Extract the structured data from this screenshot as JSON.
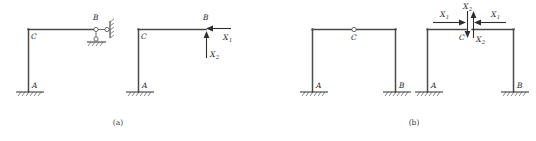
{
  "figure": {
    "captions": [
      {
        "id": "caption-a",
        "text": "(a)"
      },
      {
        "id": "caption-b",
        "text": "(b)"
      }
    ]
  },
  "part_a": {
    "caption": "(a)",
    "original_structure": {
      "description": "L-shaped frame with fixed base and two-link support",
      "joint_labels": [
        {
          "name": "C",
          "text": "C"
        },
        {
          "name": "B",
          "text": "B"
        },
        {
          "name": "A",
          "text": "A"
        }
      ],
      "supports": [
        {
          "name": "fixed-support-a",
          "type": "fixed",
          "label": "A"
        },
        {
          "name": "link-support-b-horizontal",
          "type": "roller-link",
          "label": "B"
        },
        {
          "name": "link-support-b-vertical",
          "type": "roller-link",
          "label": "B"
        }
      ]
    },
    "released_structure": {
      "description": "Primary system with redundant forces applied at B",
      "joint_labels": [
        {
          "name": "C",
          "text": "C"
        },
        {
          "name": "B",
          "text": "B"
        },
        {
          "name": "A",
          "text": "A"
        }
      ],
      "forces": [
        {
          "name": "force-x1",
          "symbol": "X",
          "subscript": "1",
          "direction": "left",
          "applied_at": "B"
        },
        {
          "name": "force-x2",
          "symbol": "X",
          "subscript": "2",
          "direction": "up",
          "applied_at": "B"
        }
      ]
    }
  },
  "part_b": {
    "caption": "(b)",
    "original_structure": {
      "description": "Portal frame with internal hinge at C, fixed at A and B",
      "joint_labels": [
        {
          "name": "C",
          "text": "C"
        },
        {
          "name": "A",
          "text": "A"
        },
        {
          "name": "B",
          "text": "B"
        }
      ],
      "supports": [
        {
          "name": "fixed-support-a",
          "type": "fixed",
          "label": "A"
        },
        {
          "name": "fixed-support-b",
          "type": "fixed",
          "label": "B"
        },
        {
          "name": "internal-hinge-c",
          "type": "hinge",
          "label": "C"
        }
      ]
    },
    "released_structure": {
      "description": "Frame cut at C into two halves with paired internal redundant forces",
      "joint_labels": [
        {
          "name": "C",
          "text": "C"
        },
        {
          "name": "A",
          "text": "A"
        },
        {
          "name": "B",
          "text": "B"
        }
      ],
      "forces": [
        {
          "name": "force-x1-left",
          "symbol": "X",
          "subscript": "1",
          "direction": "right",
          "applied_at": "C-left"
        },
        {
          "name": "force-x2-left",
          "symbol": "X",
          "subscript": "2",
          "direction": "down",
          "applied_at": "C-left"
        },
        {
          "name": "force-x1-right",
          "symbol": "X",
          "subscript": "1",
          "direction": "left",
          "applied_at": "C-right"
        },
        {
          "name": "force-x2-right",
          "symbol": "X",
          "subscript": "2",
          "direction": "up",
          "applied_at": "C-right"
        }
      ]
    }
  },
  "colors": {
    "member": "#4a4a4a",
    "label": "#2b2b2b",
    "arrow": "#2e2e2e",
    "background": "#ffffff"
  }
}
